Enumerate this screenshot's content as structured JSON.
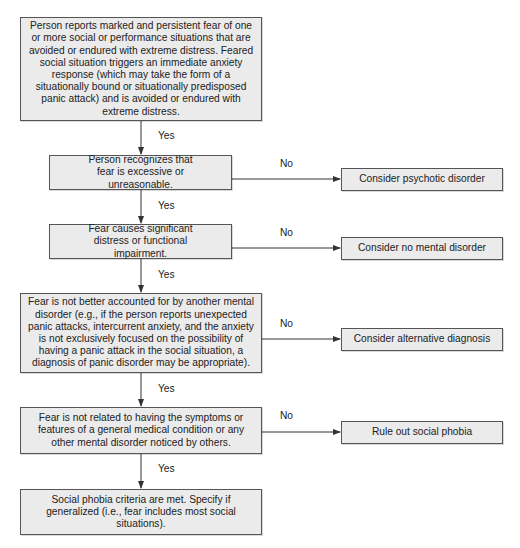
{
  "flowchart": {
    "title": "Social phobia diagnostic decision tree",
    "colors": {
      "box_fill": "#ebebeb",
      "box_border": "#555555",
      "line": "#333333",
      "text": "#222222"
    },
    "nodes": [
      {
        "id": "start",
        "text": "Person reports marked and persistent fear of one or more social or performance situations that are avoided or endured with extreme distress. Feared social situation triggers an immediate anxiety response (which may take the form of a situationally bound or situationally predisposed panic attack) and is avoided or endured with extreme distress."
      },
      {
        "id": "recognizes",
        "text": "Person recognizes that fear is excessive or unreasonable."
      },
      {
        "id": "distress",
        "text": "Fear causes significant distress or functional impairment."
      },
      {
        "id": "not-other-disorder",
        "text": "Fear is not better accounted for by another mental disorder (e.g., if the person reports unexpected panic attacks, intercurrent anxiety, and the anxiety is not exclusively focused on the possibility of having a panic attack in the social situation, a diagnosis of panic disorder may be appropriate)."
      },
      {
        "id": "not-medical",
        "text": "Fear is not related to having the symptoms or features of a general medical condition or any other mental disorder noticed by others."
      },
      {
        "id": "criteria-met",
        "text": "Social phobia criteria are met. Specify if generalized (i.e., fear includes most social situations)."
      }
    ],
    "outcomes": [
      {
        "id": "psychotic",
        "text": "Consider psychotic disorder"
      },
      {
        "id": "no-disorder",
        "text": "Consider no mental disorder"
      },
      {
        "id": "alternative",
        "text": "Consider alternative diagnosis"
      },
      {
        "id": "rule-out",
        "text": "Rule out social phobia"
      }
    ],
    "edge_labels": {
      "yes": "Yes",
      "no": "No"
    },
    "yes_edges": [
      {
        "from": "start",
        "to": "recognizes",
        "label": "Yes"
      },
      {
        "from": "recognizes",
        "to": "distress",
        "label": "Yes"
      },
      {
        "from": "distress",
        "to": "not-other-disorder",
        "label": "Yes"
      },
      {
        "from": "not-other-disorder",
        "to": "not-medical",
        "label": "Yes"
      },
      {
        "from": "not-medical",
        "to": "criteria-met",
        "label": "Yes"
      }
    ],
    "no_edges": [
      {
        "from": "recognizes",
        "to": "psychotic",
        "label": "No"
      },
      {
        "from": "distress",
        "to": "no-disorder",
        "label": "No"
      },
      {
        "from": "not-other-disorder",
        "to": "alternative",
        "label": "No"
      },
      {
        "from": "not-medical",
        "to": "rule-out",
        "label": "No"
      }
    ]
  }
}
